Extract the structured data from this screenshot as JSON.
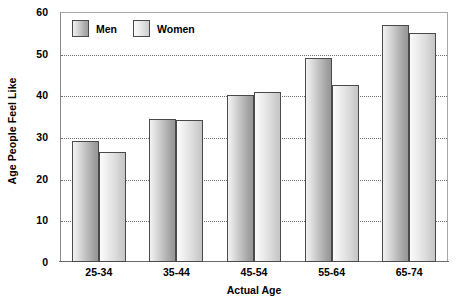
{
  "chart_data": {
    "type": "bar",
    "title": "",
    "xlabel": "Actual Age",
    "ylabel": "Age People Feel Like",
    "categories": [
      "25-34",
      "35-44",
      "45-54",
      "55-64",
      "65-74"
    ],
    "series": [
      {
        "name": "Men",
        "values": [
          29,
          34.3,
          40,
          49,
          57
        ],
        "color": "#b0b0b0"
      },
      {
        "name": "Women",
        "values": [
          26.5,
          34,
          40.7,
          42.5,
          55
        ],
        "color": "#dcdcdc"
      }
    ],
    "ylim": [
      0,
      60
    ],
    "yticks": [
      0,
      10,
      20,
      30,
      40,
      50,
      60
    ],
    "ytick_labels": [
      "0",
      "10",
      "20",
      "30",
      "40",
      "50",
      "60"
    ],
    "grid": "horizontal-dotted",
    "legend_position": "top-left-inside",
    "border_color": "#4a4a4a",
    "gridline_color": "#6f6f6f",
    "plot_border_color": "#a8a8a8"
  },
  "legend": {
    "items": [
      {
        "label": "Men"
      },
      {
        "label": "Women"
      }
    ]
  },
  "axes": {
    "y_title": "Age People Feel Like",
    "x_title": "Actual Age"
  }
}
